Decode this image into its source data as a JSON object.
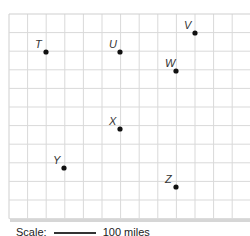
{
  "map": {
    "grid": {
      "origin_x": 9,
      "origin_y": 14,
      "cell": 18.6,
      "cols": 13,
      "rows": 11,
      "line_color": "#d9d9d9",
      "border_color": "#cfcfcf",
      "shadow_color": "#d6d6d6"
    },
    "points": [
      {
        "label": "T",
        "x": 46,
        "y": 52
      },
      {
        "label": "U",
        "x": 120,
        "y": 52
      },
      {
        "label": "V",
        "x": 195,
        "y": 33
      },
      {
        "label": "W",
        "x": 176,
        "y": 71
      },
      {
        "label": "X",
        "x": 120,
        "y": 129
      },
      {
        "label": "Y",
        "x": 64,
        "y": 168
      },
      {
        "label": "Z",
        "x": 176,
        "y": 187
      }
    ],
    "point_color": "#111111",
    "label_color": "#333333"
  },
  "scale": {
    "label": "Scale:",
    "value": "100 miles"
  }
}
